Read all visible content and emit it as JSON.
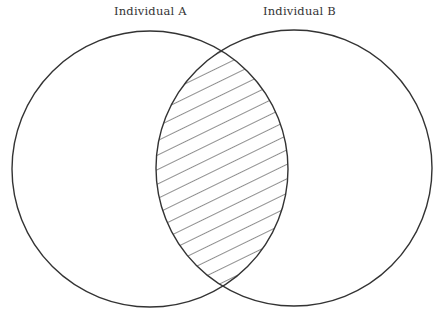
{
  "diagram": {
    "type": "venn",
    "sets": [
      {
        "label": "Individual A",
        "cx": 150,
        "cy": 169,
        "r": 138
      },
      {
        "label": "Individual B",
        "cx": 294,
        "cy": 168,
        "r": 138
      }
    ],
    "intersection": {
      "fill": "diagonal-hatching",
      "hatch_spacing": 13,
      "hatch_angle_deg": -26
    },
    "colors": {
      "stroke": "#333333",
      "background": "#ffffff"
    }
  }
}
